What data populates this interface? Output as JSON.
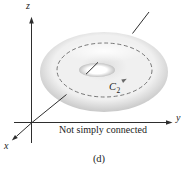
{
  "figure": {
    "caption": "Not simply connected",
    "panel_label": "(d)",
    "axis_labels": {
      "x": "x",
      "y": "y",
      "z": "z"
    },
    "curve": {
      "label_base": "C",
      "label_sub": "2"
    },
    "colors": {
      "background": "#ffffff",
      "text": "#1c1c1c",
      "axis_line": "#2e2e2e",
      "dashed_curve": "#6a6a6a",
      "torus_base": "#f0f0f0",
      "torus_rim": "#c6c6c6",
      "torus_shadow": "#dedede",
      "torus_highlight": "#ffffff",
      "hole_edge": "#c2c2c2"
    }
  }
}
